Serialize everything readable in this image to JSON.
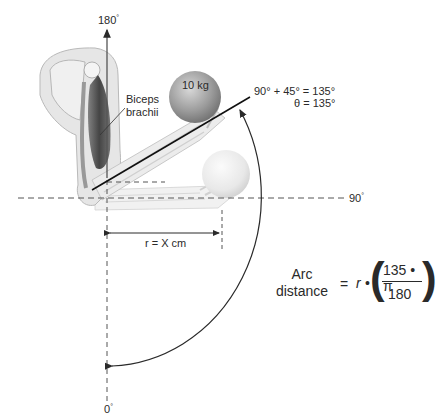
{
  "diagram": {
    "labels": {
      "top_angle": "180",
      "bottom_angle": "0",
      "right_angle": "90",
      "degree_symbol": "°",
      "muscle_line1": "Biceps",
      "muscle_line2": "brachii",
      "weight": "10 kg",
      "angle_sum": "90° + 45° = 135°",
      "theta": "θ = 135°",
      "radius": "r = X cm"
    },
    "formula": {
      "lhs_line1": "Arc",
      "lhs_line2": "distance",
      "equals": "=",
      "r": "r",
      "times": "•",
      "numerator": "135 • π",
      "denominator": "180",
      "open_paren": "(",
      "close_paren": ")"
    },
    "angles": {
      "reference_deg": 90,
      "added_deg": 45,
      "theta_deg": 135
    },
    "colors": {
      "line": "#2a2a2a",
      "dashed": "#555555",
      "skin": "#e4e4e4",
      "muscle": "#4a4a4a",
      "ball_raised": "#9a9a9a",
      "ball_lowered": "#e6e6e6"
    }
  }
}
